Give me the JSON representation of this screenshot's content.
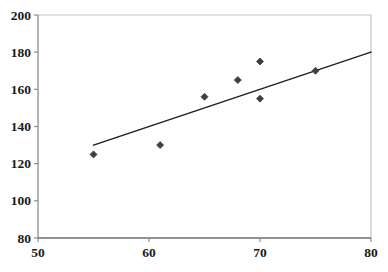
{
  "chart_data": {
    "type": "scatter",
    "title": "",
    "subtitle": "",
    "xlabel": "",
    "ylabel": "",
    "xlim": [
      50,
      80
    ],
    "ylim": [
      80,
      200
    ],
    "xticks": [
      50,
      60,
      70,
      80
    ],
    "yticks": [
      80,
      100,
      120,
      140,
      160,
      180,
      200
    ],
    "xtick_labels": [
      "50",
      "60",
      "70",
      "80"
    ],
    "ytick_labels": [
      "80",
      "100",
      "120",
      "140",
      "160",
      "180",
      "200"
    ],
    "grid": false,
    "legend": null,
    "legend_position": "none",
    "marker_shape": "diamond",
    "marker_color": "#3f3f3f",
    "marker_size": 7,
    "series": [
      {
        "name": "observations",
        "type": "scatter",
        "points": [
          {
            "x": 55,
            "y": 125
          },
          {
            "x": 61,
            "y": 130
          },
          {
            "x": 65,
            "y": 156
          },
          {
            "x": 68,
            "y": 165
          },
          {
            "x": 70,
            "y": 175
          },
          {
            "x": 70,
            "y": 155
          },
          {
            "x": 75,
            "y": 170
          }
        ]
      },
      {
        "name": "trendline",
        "type": "line",
        "color": "#1f1f1f",
        "width": 1.4,
        "points": [
          {
            "x": 55,
            "y": 130
          },
          {
            "x": 80,
            "y": 180
          }
        ]
      }
    ],
    "axis_color": "#8c8c8c",
    "plot_border_color": "#bfbfbf",
    "background_color": "#ffffff"
  },
  "figure": {
    "width": 388,
    "height": 272,
    "plot_left": 38,
    "plot_right": 371,
    "plot_top": 15,
    "plot_bottom": 238
  }
}
